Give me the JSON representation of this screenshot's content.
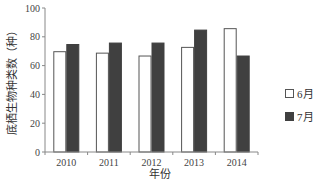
{
  "chart_data": {
    "type": "bar",
    "title": "",
    "xlabel": "年份",
    "ylabel": "底栖生物种类数（种）",
    "categories": [
      "2010",
      "2011",
      "2012",
      "2013",
      "2014"
    ],
    "series": [
      {
        "name": "6月",
        "color": "#ffffff",
        "border": "#555555",
        "values": [
          70,
          69,
          67,
          73,
          86
        ]
      },
      {
        "name": "7月",
        "color": "#404040",
        "border": "#404040",
        "values": [
          75,
          76,
          76,
          85,
          67
        ]
      }
    ],
    "ylim": [
      0,
      100
    ],
    "yticks": [
      0,
      20,
      40,
      60,
      80,
      100
    ],
    "grid": false,
    "legend_position": "right"
  },
  "legend": {
    "items": [
      {
        "label": "6月"
      },
      {
        "label": "7月"
      }
    ]
  }
}
